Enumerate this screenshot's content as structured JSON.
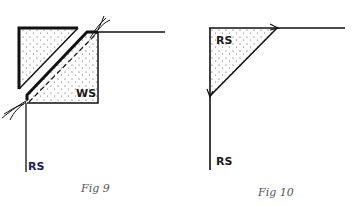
{
  "figures": [
    {
      "id": "fig9",
      "caption": "Fig  9",
      "labels": {
        "wrong_side": "WS",
        "right_side": "RS"
      }
    },
    {
      "id": "fig10",
      "caption": "Fig  10",
      "labels": {
        "right_side_top": "RS",
        "right_side_bottom": "RS"
      }
    }
  ],
  "colors": {
    "line": "#111111",
    "label_rs_fig9": "#1e1a5a",
    "caption": "#555555",
    "dots": "#444444"
  }
}
